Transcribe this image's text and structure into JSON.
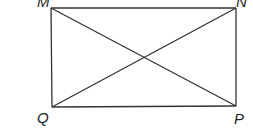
{
  "diagram": {
    "type": "rectangle-with-diagonals",
    "vertices": {
      "M": {
        "label": "M",
        "x": 51,
        "y": 8
      },
      "N": {
        "label": "N",
        "x": 236,
        "y": 8
      },
      "P": {
        "label": "P",
        "x": 236,
        "y": 106
      },
      "Q": {
        "label": "Q",
        "x": 52,
        "y": 107
      }
    },
    "segments": [
      "MN",
      "NP",
      "PQ",
      "QM",
      "MP",
      "NQ"
    ],
    "line_color": "#333333"
  }
}
